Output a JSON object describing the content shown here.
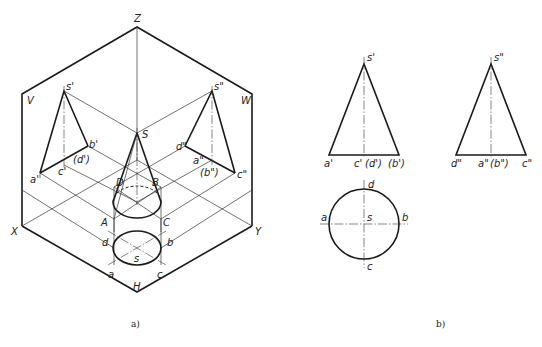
{
  "figure_a": {
    "caption": "a)",
    "axis_labels": {
      "Z": "Z",
      "X": "X",
      "Y": "Y",
      "H": "H",
      "V": "V",
      "W": "W"
    },
    "space_points": {
      "S": "S",
      "A": "A",
      "B": "B",
      "C": "C",
      "D": "D"
    },
    "v_projection": {
      "s": "s'",
      "a": "a'",
      "b": "b'",
      "c": "c'",
      "d": "(d')"
    },
    "w_projection": {
      "s": "s\"",
      "a": "a\"",
      "b": "(b\")",
      "c": "c\"",
      "d": "d\""
    },
    "h_projection": {
      "s": "s",
      "a": "a",
      "b": "b",
      "c": "c",
      "d": "d"
    }
  },
  "figure_b": {
    "caption": "b)",
    "front_view": {
      "apex": "s'",
      "base_left": "a'",
      "base_mid": "c'",
      "base_mid2": "(d')",
      "base_right": "(b')"
    },
    "side_view": {
      "apex": "s\"",
      "base_left": "d\"",
      "base_mid": "a\"",
      "base_mid2": "(b\")",
      "base_right": "c\""
    },
    "top_view": {
      "top": "d",
      "left": "a",
      "center": "s",
      "right": "b",
      "bottom": "c"
    }
  }
}
